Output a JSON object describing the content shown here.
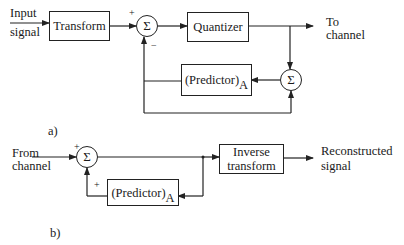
{
  "diagram_a": {
    "label": "a)",
    "input_label_line1": "Input",
    "input_label_line2": "signal",
    "transform_block": "Transform",
    "summer1": {
      "symbol": "Σ",
      "plus_sign": "+",
      "minus_sign": "−"
    },
    "quantizer_block": "Quantizer",
    "output_label_line1": "To",
    "output_label_line2": "channel",
    "summer2": {
      "symbol": "Σ"
    },
    "predictor_block": {
      "text": "(Predictor)",
      "subscript": "A"
    }
  },
  "diagram_b": {
    "label": "b)",
    "input_label_line1": "From",
    "input_label_line2": "channel",
    "summer": {
      "symbol": "Σ",
      "plus_top": "+",
      "plus_bottom": "+"
    },
    "predictor_block": {
      "text": "(Predictor)",
      "subscript": "A"
    },
    "inverse_block_line1": "Inverse",
    "inverse_block_line2": "transform",
    "output_label_line1": "Reconstructed",
    "output_label_line2": "signal"
  }
}
